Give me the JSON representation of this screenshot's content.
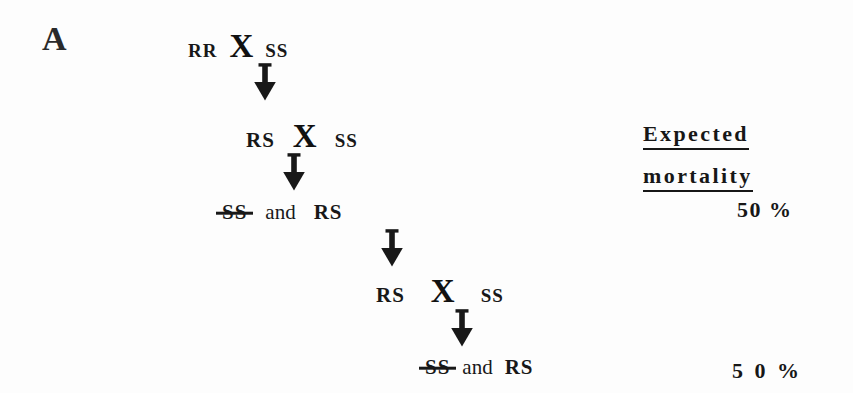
{
  "figure": {
    "panel_label": "A",
    "background_color": "#fdfdfd",
    "ink_color": "#181818"
  },
  "crosses": [
    {
      "id": "generation-1",
      "parent_left": "RR",
      "cross_symbol": "X",
      "parent_right": "SS"
    },
    {
      "id": "generation-2",
      "parent_left": "RS",
      "cross_symbol": "X",
      "parent_right": "SS"
    },
    {
      "id": "generation-3-offspring",
      "dead_genotype": "SS",
      "conjunction": "and",
      "live_genotype": "RS"
    },
    {
      "id": "generation-4",
      "parent_left": "RS",
      "cross_symbol": "X",
      "parent_right": "SS"
    },
    {
      "id": "generation-5-offspring",
      "dead_genotype": "SS",
      "conjunction": "and",
      "live_genotype": "RS"
    }
  ],
  "arrows": [
    {
      "id": "arrow-1",
      "glyph": "down-arrow"
    },
    {
      "id": "arrow-2",
      "glyph": "down-arrow"
    },
    {
      "id": "arrow-3",
      "glyph": "down-arrow"
    },
    {
      "id": "arrow-4",
      "glyph": "down-arrow"
    }
  ],
  "mortality": {
    "heading_line1": "Expected",
    "heading_line2": "mortality",
    "value_1": "50 %",
    "value_2": "5 0 %"
  }
}
